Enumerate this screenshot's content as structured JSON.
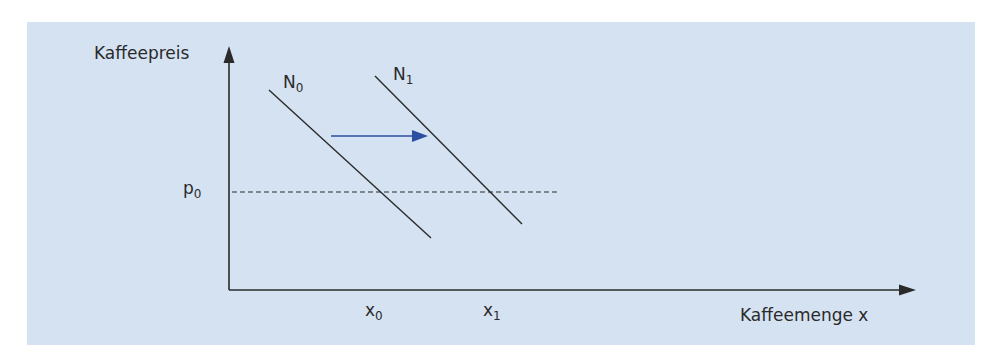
{
  "diagram": {
    "title": "",
    "background_color": "#d5e2f2",
    "line_color": "#2a2a2a",
    "shift_arrow_color": "#2b4fa0",
    "y_axis": {
      "label": "Kaffeepreis"
    },
    "x_axis": {
      "label": "Kaffeemenge x"
    },
    "curves": [
      {
        "id": "N0",
        "label_main": "N",
        "label_sub": "0",
        "description": "ursprüngliche Nachfragekurve"
      },
      {
        "id": "N1",
        "label_main": "N",
        "label_sub": "1",
        "description": "verschobene Nachfragekurve"
      }
    ],
    "price_level": {
      "label_main": "p",
      "label_sub": "0",
      "style": "dashed"
    },
    "quantities": [
      {
        "label_main": "x",
        "label_sub": "0"
      },
      {
        "label_main": "x",
        "label_sub": "1"
      }
    ],
    "shift": {
      "direction": "right",
      "from": "N0",
      "to": "N1"
    }
  }
}
